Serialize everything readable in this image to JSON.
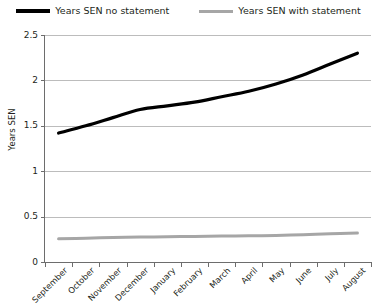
{
  "chart_data": {
    "type": "line",
    "title": "",
    "xlabel": "",
    "ylabel": "Years SEN",
    "categories": [
      "September",
      "October",
      "November",
      "December",
      "January",
      "February",
      "March",
      "April",
      "May",
      "June",
      "July",
      "August"
    ],
    "ylim": [
      0,
      2.5
    ],
    "ytick_labels": [
      "2.5",
      "2",
      "1.5",
      "1",
      "0.5",
      "0"
    ],
    "ytick_values": [
      2.5,
      2,
      1.5,
      1,
      0.5,
      0
    ],
    "grid": true,
    "legend_position": "top",
    "series": [
      {
        "name": "Years SEN no statement",
        "color": "#000000",
        "width": 3.2,
        "values": [
          1.42,
          1.5,
          1.59,
          1.68,
          1.72,
          1.76,
          1.82,
          1.88,
          1.96,
          2.06,
          2.18,
          2.3
        ]
      },
      {
        "name": "Years SEN with statement",
        "color": "#a6a6a6",
        "width": 3.0,
        "values": [
          0.255,
          0.262,
          0.27,
          0.275,
          0.278,
          0.282,
          0.285,
          0.288,
          0.292,
          0.3,
          0.31,
          0.32
        ]
      }
    ]
  },
  "legend": {
    "items": [
      {
        "label": "Years SEN no statement",
        "color": "#000000"
      },
      {
        "label": "Years SEN with statement",
        "color": "#a6a6a6"
      }
    ]
  },
  "axes": {
    "y_title": "Years SEN"
  }
}
